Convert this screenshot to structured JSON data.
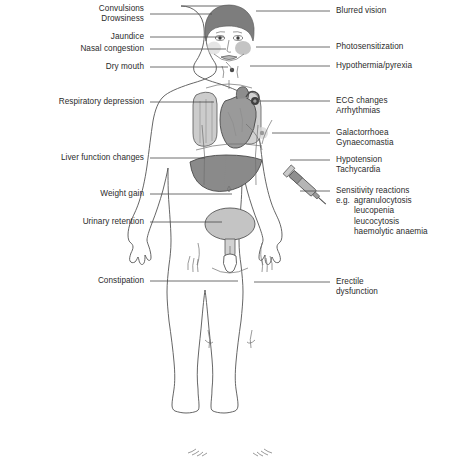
{
  "figure": {
    "colors": {
      "outline": "#555555",
      "hair": "#7d7d7d",
      "lung": "#cccccc",
      "heart": "#9a9a9a",
      "liver": "#8a8a8a",
      "bladder": "#c4c4c4",
      "syringe": "#b5b5b5",
      "cheek_flush": "#b3b3b3",
      "leader_line": "#4a4a4a",
      "text": "#2b2b2b",
      "background": "#ffffff"
    }
  },
  "left_labels": [
    {
      "id": "convulsions-drowsiness",
      "lines": [
        "Convulsions",
        "Drowsiness"
      ],
      "x_right": 144,
      "y": 4,
      "leader_y": 14,
      "leader_x1": 150,
      "leader_x2": 212
    },
    {
      "id": "jaundice",
      "lines": [
        "Jaundice"
      ],
      "x_right": 144,
      "y": 32,
      "leader_y": 37,
      "leader_x1": 150,
      "leader_x2": 224
    },
    {
      "id": "nasal-congestion",
      "lines": [
        "Nasal congestion"
      ],
      "x_right": 144,
      "y": 44,
      "leader_y": 49,
      "leader_x1": 150,
      "leader_x2": 226
    },
    {
      "id": "dry-mouth",
      "lines": [
        "Dry mouth"
      ],
      "x_right": 144,
      "y": 62,
      "leader_y": 67,
      "leader_x1": 150,
      "leader_x2": 228
    },
    {
      "id": "respiratory-depression",
      "lines": [
        "Respiratory depression"
      ],
      "x_right": 144,
      "y": 97,
      "leader_y": 102,
      "leader_x1": 150,
      "leader_x2": 214
    },
    {
      "id": "liver-function-changes",
      "lines": [
        "Liver function changes"
      ],
      "x_right": 144,
      "y": 153,
      "leader_y": 158,
      "leader_x1": 150,
      "leader_x2": 205
    },
    {
      "id": "weight-gain",
      "lines": [
        "Weight gain"
      ],
      "x_right": 144,
      "y": 189,
      "leader_y": 194,
      "leader_x1": 150,
      "leader_x2": 232
    },
    {
      "id": "urinary-retention",
      "lines": [
        "Urinary retention"
      ],
      "x_right": 144,
      "y": 217,
      "leader_y": 222,
      "leader_x1": 150,
      "leader_x2": 222
    },
    {
      "id": "constipation",
      "lines": [
        "Constipation"
      ],
      "x_right": 144,
      "y": 276,
      "leader_y": 281,
      "leader_x1": 150,
      "leader_x2": 238
    }
  ],
  "right_labels": [
    {
      "id": "blurred-vision",
      "lines": [
        "Blurred vision"
      ],
      "x_left": 336,
      "y": 6,
      "leader_y": 11,
      "leader_x1": 256,
      "leader_x2": 330
    },
    {
      "id": "photosensitization",
      "lines": [
        "Photosensitization"
      ],
      "x_left": 336,
      "y": 42,
      "leader_y": 47,
      "leader_x1": 256,
      "leader_x2": 330
    },
    {
      "id": "hypothermia-pyrexia",
      "lines": [
        "Hypothermia/pyrexia"
      ],
      "x_left": 336,
      "y": 61,
      "leader_y": 66,
      "leader_x1": 250,
      "leader_x2": 330
    },
    {
      "id": "ecg-changes-arrhythmias",
      "lines": [
        "ECG changes",
        "Arrhythmias"
      ],
      "x_left": 336,
      "y": 96,
      "leader_y": 101,
      "leader_x1": 254,
      "leader_x2": 330
    },
    {
      "id": "galactorrhoea-gynaecomastia",
      "lines": [
        "Galactorrhoea",
        "Gynaecomastia"
      ],
      "x_left": 336,
      "y": 128,
      "leader_y": 133,
      "leader_x1": 272,
      "leader_x2": 330
    },
    {
      "id": "hypotension-tachycardia",
      "lines": [
        "Hypotension",
        "Tachycardia"
      ],
      "x_left": 336,
      "y": 155,
      "leader_y": 160,
      "leader_x1": 290,
      "leader_x2": 330
    },
    {
      "id": "erectile-dysfunction",
      "lines": [
        "Erectile",
        "dysfunction"
      ],
      "x_left": 336,
      "y": 277,
      "leader_y": 282,
      "leader_x1": 254,
      "leader_x2": 330
    }
  ],
  "sensitivity_reactions": {
    "id": "sensitivity-reactions",
    "heading": "Sensitivity reactions",
    "eg_label": "e.g.",
    "items": [
      "agranulocytosis",
      "leucopenia",
      "leucocytosis",
      "haemolytic anaemia"
    ],
    "x_left": 336,
    "y": 186,
    "leader_y": 191,
    "leader_x1": 300,
    "leader_x2": 330
  },
  "body_parts": [
    {
      "id": "head",
      "label": "head"
    },
    {
      "id": "hair",
      "label": "hair"
    },
    {
      "id": "left-lung",
      "label": "lung"
    },
    {
      "id": "heart",
      "label": "heart"
    },
    {
      "id": "liver",
      "label": "liver"
    },
    {
      "id": "bladder",
      "label": "bladder"
    },
    {
      "id": "syringe",
      "label": "syringe"
    },
    {
      "id": "nipple",
      "label": "nipple"
    },
    {
      "id": "navel",
      "label": "navel"
    }
  ]
}
